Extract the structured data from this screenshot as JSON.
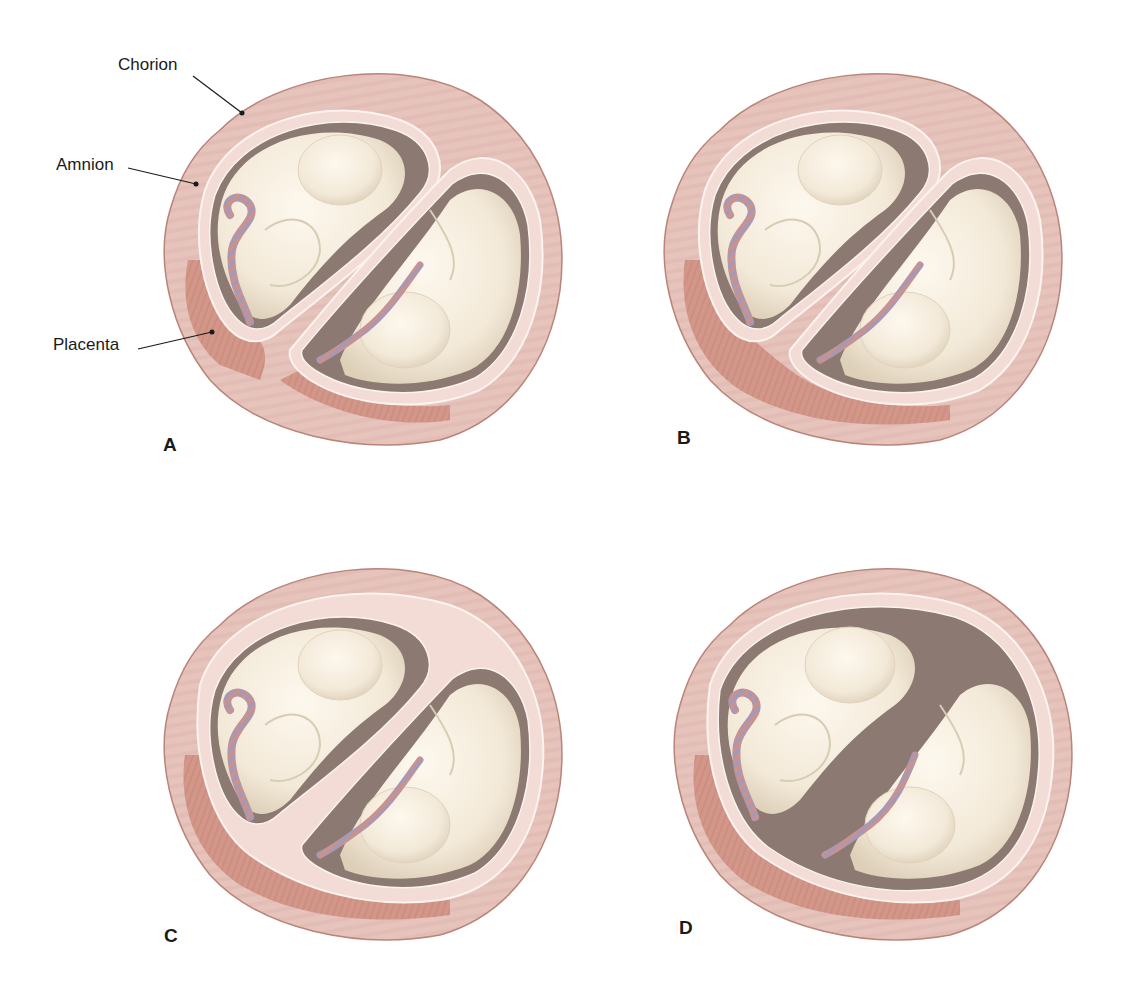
{
  "figure": {
    "colors": {
      "uterine_wall": "#e6c3bb",
      "uterine_wall_edge": "#b98479",
      "membrane": "#f3dcd6",
      "membrane_line": "#fbf3ef",
      "placenta": "#d3978a",
      "placenta_dark": "#c8887a",
      "cavity": "#8c7a72",
      "fetus": "#f6eedf",
      "fetus_shade": "#e3d7c2",
      "cord_a": "#c9928e",
      "cord_b": "#a898b4",
      "text": "#1a1a1a"
    },
    "callouts": [
      {
        "id": "chorion",
        "label": "Chorion"
      },
      {
        "id": "amnion",
        "label": "Amnion"
      },
      {
        "id": "placenta",
        "label": "Placenta"
      }
    ],
    "panels": [
      {
        "letter": "A",
        "placentas": 2,
        "chorions": 2,
        "amnions": 2,
        "arrangement": "separate placentas, separate chorions and amnions"
      },
      {
        "letter": "B",
        "placentas": 1,
        "chorions": 2,
        "amnions": 2,
        "arrangement": "fused placenta, two chorions, two amnions"
      },
      {
        "letter": "C",
        "placentas": 1,
        "chorions": 1,
        "amnions": 2,
        "arrangement": "single placenta, single chorion, two amnions"
      },
      {
        "letter": "D",
        "placentas": 1,
        "chorions": 1,
        "amnions": 1,
        "arrangement": "single placenta, single chorion, single amnion"
      }
    ]
  }
}
